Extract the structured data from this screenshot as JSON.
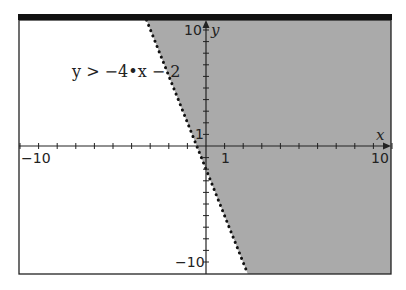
{
  "chart_data": {
    "type": "area",
    "title": "",
    "inequality": "y > -4•x - 2",
    "boundary": {
      "slope": -4,
      "intercept": -2,
      "style": "dotted"
    },
    "shading": {
      "region": "above",
      "color": "#aaaaaa"
    },
    "xlabel": "x",
    "ylabel": "y",
    "xlim": [
      -10,
      10
    ],
    "ylim": [
      -11,
      10.9
    ],
    "x_ticks_labeled": [
      "-10",
      "1",
      "10"
    ],
    "y_ticks_labeled": [
      "10",
      "1",
      "-10"
    ],
    "grid": false,
    "legend": null
  },
  "labels": {
    "inequality": "y > −4•x − 2",
    "x_axis": "x",
    "y_axis": "y",
    "x_neg10": "−10",
    "x_1": "1",
    "x_10": "10",
    "y_10": "10",
    "y_1": "1",
    "y_neg10": "−10"
  },
  "colors": {
    "shade": "#aaaaaa",
    "frame": "#111111",
    "axis": "#222222",
    "boundary": "#111111"
  }
}
